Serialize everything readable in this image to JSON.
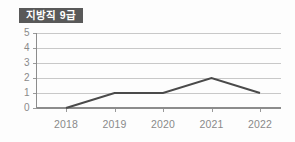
{
  "card": {
    "title": "지방직 9급",
    "badge_bg": "#595959",
    "badge_fg": "#ffffff",
    "background": "#fdfdfd"
  },
  "chart_data": {
    "type": "line",
    "title": "지방직 9급",
    "xlabel": "",
    "ylabel": "",
    "categories": [
      "2018",
      "2019",
      "2020",
      "2021",
      "2022"
    ],
    "values": [
      0,
      1,
      1,
      2,
      1
    ],
    "series": [
      {
        "name": "지방직 9급",
        "values": [
          0,
          1,
          1,
          2,
          1
        ],
        "color": "#4a4a4a"
      }
    ],
    "ylim": [
      0,
      5
    ],
    "yticks": [
      "0",
      "1",
      "2",
      "3",
      "4",
      "5"
    ],
    "ytick_values": [
      0,
      1,
      2,
      3,
      4,
      5
    ],
    "grid": true,
    "grid_orientation": "horizontal",
    "grid_color": "#c8c8c8",
    "legend": false,
    "legend_position": "none",
    "markers": false,
    "axis_color": "#8c8c8c",
    "tick_label_color": "#8a8a8a"
  }
}
